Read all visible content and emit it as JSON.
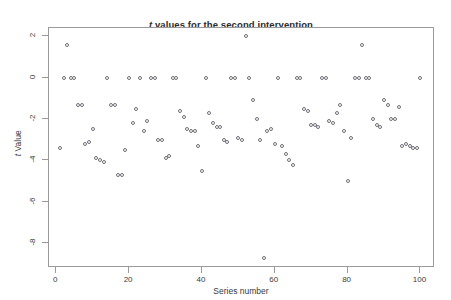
{
  "chart_data": {
    "type": "scatter",
    "title": "t values for the second intervention",
    "title_italic_prefix": "t",
    "title_rest": " values for the second intervention",
    "xlabel": "Series number",
    "ylabel": "t Value",
    "ylabel_italic_prefix": "t",
    "ylabel_rest": " Value",
    "xlim": [
      -2,
      104
    ],
    "ylim": [
      -9.2,
      2.4
    ],
    "xticks": [
      0,
      20,
      40,
      60,
      80,
      100
    ],
    "yticks": [
      2,
      0,
      -2,
      -4,
      -6,
      -8
    ],
    "grid": false,
    "legend": false,
    "marker": "open-circle",
    "marker_color": "#6f6f76",
    "frame_color": "#9a9a9a",
    "background": "#ffffff",
    "n_points": 100,
    "x": [
      1,
      2,
      3,
      4,
      5,
      6,
      7,
      8,
      9,
      10,
      11,
      12,
      13,
      14,
      15,
      16,
      17,
      18,
      19,
      20,
      21,
      22,
      23,
      24,
      25,
      26,
      27,
      28,
      29,
      30,
      31,
      32,
      33,
      34,
      35,
      36,
      37,
      38,
      39,
      40,
      41,
      42,
      43,
      44,
      45,
      46,
      47,
      48,
      49,
      50,
      51,
      52,
      53,
      54,
      55,
      56,
      57,
      58,
      59,
      60,
      61,
      62,
      63,
      64,
      65,
      66,
      67,
      68,
      69,
      70,
      71,
      72,
      73,
      74,
      75,
      76,
      77,
      78,
      79,
      80,
      81,
      82,
      83,
      84,
      85,
      86,
      87,
      88,
      89,
      90,
      91,
      92,
      93,
      94,
      95,
      96,
      97,
      98,
      99,
      100
    ],
    "y": [
      -3.4,
      0.0,
      1.6,
      0.0,
      0.0,
      -1.3,
      -1.3,
      -3.2,
      -3.1,
      -2.5,
      -3.9,
      -4.0,
      -4.1,
      0.0,
      -1.3,
      -1.3,
      -4.7,
      -4.7,
      -3.5,
      0.0,
      -2.2,
      -1.5,
      0.0,
      -2.6,
      -2.1,
      0.0,
      0.0,
      -3.0,
      -3.0,
      -3.9,
      -3.8,
      0.0,
      0.0,
      -1.6,
      -1.9,
      -2.5,
      -2.6,
      -2.6,
      -3.3,
      -4.5,
      0.0,
      -1.7,
      -2.2,
      -2.4,
      -2.4,
      -3.0,
      -3.1,
      0.0,
      0.0,
      -2.9,
      -3.0,
      2.0,
      0.0,
      -1.1,
      -2.0,
      -3.0,
      -8.7,
      -2.6,
      -2.5,
      -3.2,
      0.0,
      -3.3,
      -3.7,
      -4.0,
      -4.2,
      0.0,
      0.0,
      -1.5,
      -1.6,
      -2.3,
      -2.3,
      -2.4,
      0.0,
      0.0,
      -2.1,
      -2.2,
      -1.7,
      -1.3,
      -2.6,
      -5.0,
      -2.9,
      0.0,
      0.0,
      1.6,
      0.0,
      0.0,
      -2.0,
      -2.3,
      -2.4,
      -1.1,
      -1.3,
      -2.0,
      -2.0,
      -1.4,
      -3.3,
      -3.2,
      -3.3,
      -3.4,
      -3.4,
      0.0
    ]
  }
}
